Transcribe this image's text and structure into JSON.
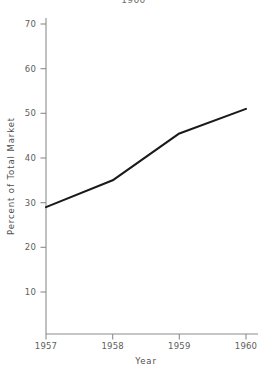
{
  "top_fragment": "1960",
  "chart_data": {
    "type": "line",
    "title": "",
    "xlabel": "Year",
    "ylabel": "Percent of Total Market",
    "x": [
      1957,
      1958,
      1959,
      1960
    ],
    "values": [
      29,
      35,
      45.5,
      51
    ],
    "xticklabels": [
      "1957",
      "1958",
      "1959",
      "1960"
    ],
    "yticklabels": [
      "10",
      "20",
      "30",
      "40",
      "50",
      "60",
      "70"
    ],
    "yticks": [
      10,
      20,
      30,
      40,
      50,
      60,
      70
    ],
    "xlim": [
      1957,
      1960
    ],
    "ylim": [
      4,
      74
    ],
    "grid": false,
    "legend": false,
    "series": [
      {
        "name": "Percent of Total Market",
        "values": [
          29,
          35,
          45.5,
          51
        ],
        "color": "#1a1a1a"
      }
    ],
    "line_color": "#1a1a1a",
    "axis_color": "#8c8c8c"
  },
  "ticks": {
    "y": [
      {
        "label": "70",
        "y": 24
      },
      {
        "label": "60",
        "y": 68.7
      },
      {
        "label": "50",
        "y": 113.3
      },
      {
        "label": "40",
        "y": 158
      },
      {
        "label": "30",
        "y": 202.7
      },
      {
        "label": "20",
        "y": 247.3
      },
      {
        "label": "10",
        "y": 292
      }
    ],
    "x": [
      {
        "label": "1957",
        "x": 46
      },
      {
        "label": "1958",
        "x": 112.7
      },
      {
        "label": "1959",
        "x": 179.3
      },
      {
        "label": "1960",
        "x": 246
      }
    ]
  },
  "points": [
    {
      "x": 46,
      "y": 208.8
    },
    {
      "x": 112.7,
      "y": 181.0
    },
    {
      "x": 179.3,
      "y": 133.0
    },
    {
      "x": 246,
      "y": 108.7
    }
  ]
}
